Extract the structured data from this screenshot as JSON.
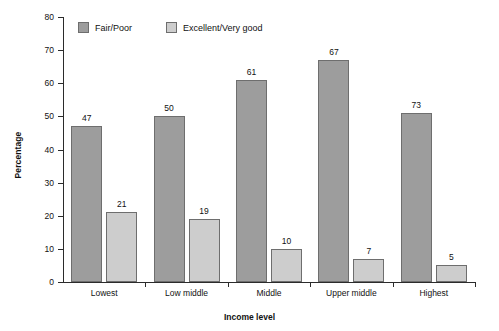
{
  "chart_data": {
    "type": "bar",
    "title": "",
    "xlabel": "Income level",
    "ylabel": "Percentage",
    "categories": [
      "Lowest",
      "Low middle",
      "Middle",
      "Upper middle",
      "Highest"
    ],
    "series": [
      {
        "name": "Fair/Poor",
        "values": [
          47,
          50,
          61,
          67,
          73
        ],
        "color": "#9d9d9d"
      },
      {
        "name": "Excellent/Very good",
        "values": [
          21,
          19,
          10,
          7,
          5
        ],
        "color": "#cdcdcd"
      }
    ],
    "ylim": [
      0,
      80
    ],
    "ytick_labels": [
      "0",
      "10",
      "20",
      "30",
      "40",
      "50",
      "60",
      "70",
      "80"
    ],
    "ytick_values": [
      0,
      10,
      20,
      30,
      40,
      50,
      60,
      70,
      80
    ],
    "grid": false,
    "legend_position": "top-left-inside",
    "bar_drawn_heights": {
      "Fair/Poor": [
        47,
        50,
        61,
        67,
        51
      ],
      "Excellent/Very good": [
        21,
        19,
        10,
        7,
        5
      ]
    }
  }
}
